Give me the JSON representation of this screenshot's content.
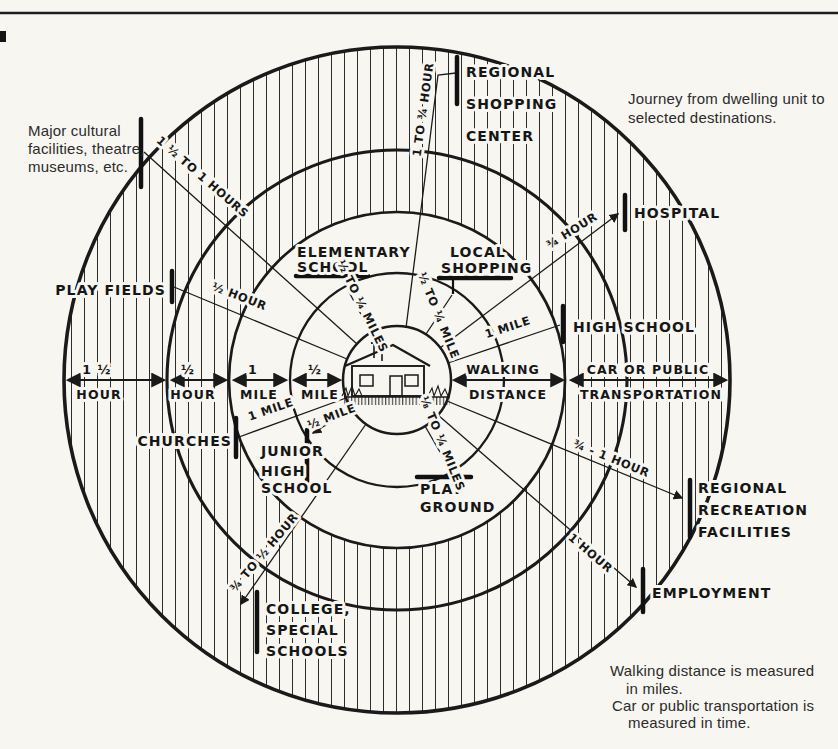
{
  "notes": {
    "journey": [
      "Journey from dwelling unit to",
      "selected destinations."
    ],
    "cultural": [
      "Major cultural",
      "facilities, theatre,",
      "museums, etc."
    ],
    "legend": [
      "Walking distance is measured",
      "in miles.",
      "Car or public transportation is",
      "measured in time."
    ]
  },
  "axis": {
    "segments": [
      {
        "top": "1 ½",
        "bottom": "HOUR"
      },
      {
        "top": "½",
        "bottom": "HOUR"
      },
      {
        "top": "1",
        "bottom": "MILE"
      },
      {
        "top": "½",
        "bottom": "MILE"
      },
      {
        "top": "WALKING",
        "bottom": "DISTANCE"
      },
      {
        "top": "CAR OR PUBLIC",
        "bottom": "TRANSPORTATION"
      }
    ]
  },
  "destinations": {
    "regional_shopping": {
      "lines": [
        "REGIONAL",
        "SHOPPING",
        "CENTER"
      ],
      "journey": "1 TO ¾ HOUR"
    },
    "cultural": {
      "journey": "1 ½ TO 1 HOURS"
    },
    "play_fields": {
      "lines": [
        "PLAY FIELDS"
      ],
      "journey": "½ HOUR"
    },
    "hospital": {
      "lines": [
        "HOSPITAL"
      ],
      "journey": "¾ HOUR"
    },
    "high_school": {
      "lines": [
        "HIGH SCHOOL"
      ],
      "journey": "1 MILE"
    },
    "elementary_school": {
      "lines": [
        "ELEMENTARY",
        "SCHOOL"
      ],
      "journey": "½ TO ¼ MILES"
    },
    "local_shopping": {
      "lines": [
        "LOCAL",
        "SHOPPING"
      ],
      "journey": "½ TO ¼ MILE"
    },
    "churches": {
      "lines": [
        "CHURCHES"
      ],
      "journey": "1 MILE"
    },
    "junior_high": {
      "lines": [
        "JUNIOR",
        "HIGH",
        "SCHOOL"
      ],
      "journey": "½ MILE"
    },
    "playground": {
      "lines": [
        "PLAY",
        "GROUND"
      ],
      "journey": "⅛ TO ¼ MILES"
    },
    "college": {
      "lines": [
        "COLLEGE,",
        "SPECIAL",
        "SCHOOLS"
      ],
      "journey": "¾ TO ½ HOUR"
    },
    "recreation": {
      "lines": [
        "REGIONAL",
        "RECREATION",
        "FACILITIES"
      ],
      "journey": "¾ - 1 HOUR"
    },
    "employment": {
      "lines": [
        "EMPLOYMENT"
      ],
      "journey": "1 HOUR"
    }
  }
}
